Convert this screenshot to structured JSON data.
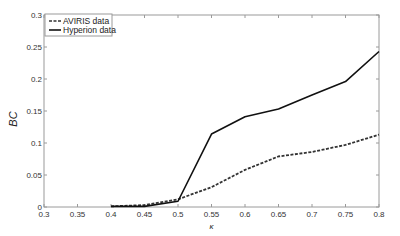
{
  "chart_data": {
    "type": "line",
    "title": "",
    "xlabel": "κ",
    "ylabel": "BC",
    "xlim": [
      0.3,
      0.8
    ],
    "ylim": [
      0,
      0.3
    ],
    "xticks": [
      0.3,
      0.35,
      0.4,
      0.45,
      0.5,
      0.55,
      0.6,
      0.65,
      0.7,
      0.75,
      0.8
    ],
    "xtick_labels": [
      "0.3",
      "0.35",
      "0.4",
      "0.45",
      "0.5",
      "0.55",
      "0.6",
      "0.65",
      "0.7",
      "0.75",
      "0.8"
    ],
    "yticks": [
      0,
      0.05,
      0.1,
      0.15,
      0.2,
      0.25,
      0.3
    ],
    "ytick_labels": [
      "0",
      "0.05",
      "0.1",
      "0.15",
      "0.2",
      "0.25",
      "0.3"
    ],
    "grid": false,
    "legend_position": "top-left",
    "x": [
      0.4,
      0.45,
      0.5,
      0.55,
      0.6,
      0.65,
      0.7,
      0.75,
      0.8
    ],
    "series": [
      {
        "name": "AVIRIS data",
        "style": "dashed",
        "color": "#333333",
        "values": [
          0.001,
          0.003,
          0.012,
          0.031,
          0.058,
          0.079,
          0.086,
          0.097,
          0.113
        ]
      },
      {
        "name": "Hyperion data",
        "style": "solid",
        "color": "#111111",
        "values": [
          0.001,
          0.001,
          0.009,
          0.114,
          0.141,
          0.153,
          0.175,
          0.196,
          0.243
        ]
      }
    ]
  }
}
